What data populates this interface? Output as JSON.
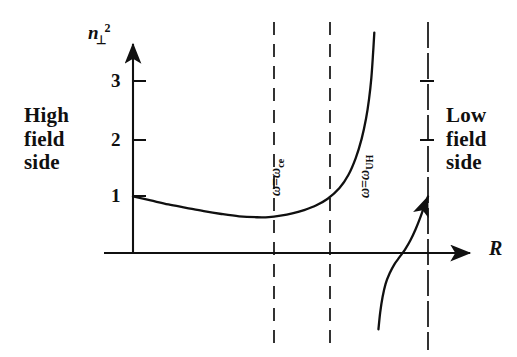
{
  "figure": {
    "annotations": {
      "high_field_side": "High\nfield\nside",
      "low_field_side": "Low\nfield\nside"
    },
    "axis_labels": {
      "y_symbol": "n",
      "y_subscript": "⊥",
      "y_superscript": "2",
      "x_symbol": "R"
    },
    "resonance_labels": {
      "cyclotron": {
        "lhs": "ω",
        "eq": "=",
        "rhs": "ω",
        "sub": "ce"
      },
      "upper_hybrid": {
        "lhs": "ω",
        "eq": "=",
        "rhs": "ω",
        "sub": "UH"
      }
    },
    "colors": {
      "ink": "#101010",
      "background": "#ffffff"
    }
  },
  "chart_data": {
    "type": "line",
    "title": "",
    "xlabel": "R",
    "ylabel": "n_⊥^2",
    "xlim": [
      0,
      1
    ],
    "ylim": [
      -1.35,
      3.9
    ],
    "grid": false,
    "legend": null,
    "y_ticks": [
      1,
      2,
      3
    ],
    "y_tick_labels": [
      "1",
      "2",
      "3"
    ],
    "x_ticks": [],
    "x_tick_labels": [],
    "asymptotes": [
      {
        "name": "ω = ω_ce",
        "x_px": 274,
        "style": "dashed",
        "note": "electron cyclotron resonance"
      },
      {
        "name": "ω = ω_UH",
        "x_px": 330,
        "style": "dashed",
        "note": "upper hybrid resonance"
      },
      {
        "name": "plasma-edge",
        "x_px": 428,
        "style": "dashed",
        "note": "right boundary, curve ends at n^2 = 1"
      }
    ],
    "series": [
      {
        "name": "branch-left",
        "comment": "starts at n^2=1 on the axis, dips to a minimum ~0.63, crosses omega_ce, diverges to +infinity at omega_UH",
        "points": [
          [
            0.0,
            1.0
          ],
          [
            0.06,
            0.93
          ],
          [
            0.12,
            0.86
          ],
          [
            0.18,
            0.8
          ],
          [
            0.24,
            0.74
          ],
          [
            0.3,
            0.69
          ],
          [
            0.36,
            0.65
          ],
          [
            0.42,
            0.633
          ],
          [
            0.46,
            0.635
          ],
          [
            0.5,
            0.66
          ],
          [
            0.54,
            0.7
          ],
          [
            0.58,
            0.76
          ],
          [
            0.62,
            0.84
          ],
          [
            0.66,
            0.96
          ],
          [
            0.7,
            1.15
          ],
          [
            0.73,
            1.38
          ],
          [
            0.755,
            1.68
          ],
          [
            0.775,
            2.02
          ],
          [
            0.79,
            2.38
          ],
          [
            0.8,
            2.72
          ],
          [
            0.808,
            3.1
          ],
          [
            0.814,
            3.55
          ],
          [
            0.818,
            3.9
          ]
        ]
      },
      {
        "name": "branch-right",
        "comment": "emerges from -infinity just right of omega_UH, crosses zero, terminates at n^2 = 1 on the plasma-edge line",
        "points": [
          [
            0.832,
            -1.35
          ],
          [
            0.838,
            -1.05
          ],
          [
            0.846,
            -0.78
          ],
          [
            0.856,
            -0.55
          ],
          [
            0.87,
            -0.36
          ],
          [
            0.886,
            -0.2
          ],
          [
            0.904,
            -0.07
          ],
          [
            0.922,
            0.06
          ],
          [
            0.94,
            0.22
          ],
          [
            0.958,
            0.42
          ],
          [
            0.974,
            0.63
          ],
          [
            0.988,
            0.84
          ],
          [
            1.0,
            1.0
          ]
        ]
      }
    ]
  }
}
